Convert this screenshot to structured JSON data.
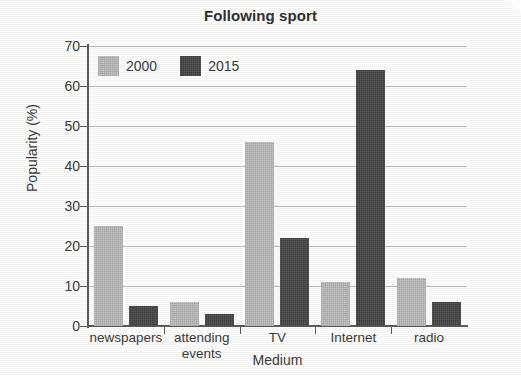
{
  "chart_data": {
    "type": "bar",
    "title": "Following sport",
    "xlabel": "Medium",
    "ylabel": "Popularity (%)",
    "categories": [
      "newspapers",
      "attending events",
      "TV",
      "Internet",
      "radio"
    ],
    "series": [
      {
        "name": "2000",
        "color": "#c6c6c4",
        "values": [
          25,
          6,
          46,
          11,
          12
        ]
      },
      {
        "name": "2015",
        "color": "#3d3d3d",
        "values": [
          5,
          3,
          22,
          64,
          6
        ]
      }
    ],
    "ylim": [
      0,
      70
    ],
    "yticks": [
      0,
      10,
      20,
      30,
      40,
      50,
      60,
      70
    ],
    "ytick_labels": [
      "0",
      "10",
      "20",
      "30",
      "40",
      "50",
      "60",
      "70"
    ],
    "grid": true,
    "legend_position": "top-left-inside"
  },
  "legend": {
    "items": [
      {
        "label": "2000"
      },
      {
        "label": "2015"
      }
    ]
  }
}
